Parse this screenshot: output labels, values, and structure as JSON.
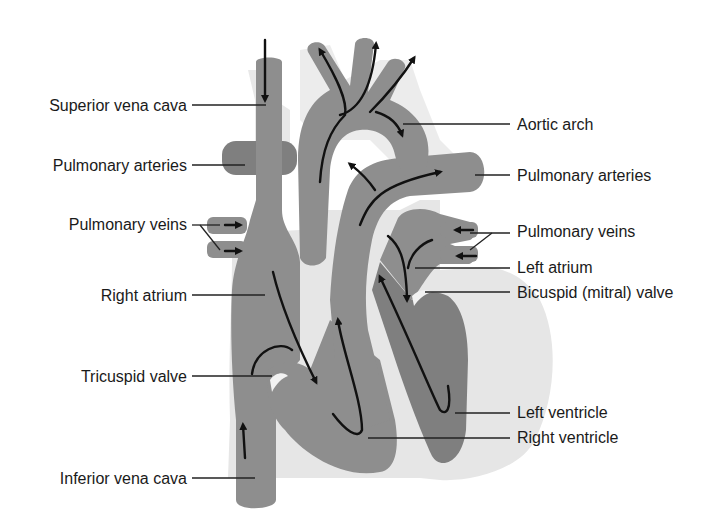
{
  "colors": {
    "vessel": "#8e8e8e",
    "heart_outline": "#e6e6e6",
    "arrow": "#111111",
    "label_text": "#1a1a1a",
    "background": "#ffffff"
  },
  "labels": {
    "left": [
      {
        "id": "superior-vena-cava",
        "text": "Superior vena cava"
      },
      {
        "id": "pulmonary-arteries-left",
        "text": "Pulmonary arteries"
      },
      {
        "id": "pulmonary-veins-left",
        "text": "Pulmonary veins"
      },
      {
        "id": "right-atrium",
        "text": "Right atrium"
      },
      {
        "id": "tricuspid-valve",
        "text": "Tricuspid valve"
      },
      {
        "id": "inferior-vena-cava",
        "text": "Inferior vena cava"
      }
    ],
    "right": [
      {
        "id": "aortic-arch",
        "text": "Aortic arch"
      },
      {
        "id": "pulmonary-arteries-right",
        "text": "Pulmonary arteries"
      },
      {
        "id": "pulmonary-veins-right",
        "text": "Pulmonary veins"
      },
      {
        "id": "left-atrium",
        "text": "Left atrium"
      },
      {
        "id": "bicuspid-valve",
        "text": "Bicuspid (mitral) valve"
      },
      {
        "id": "left-ventricle",
        "text": "Left ventricle"
      },
      {
        "id": "right-ventricle",
        "text": "Right ventricle"
      }
    ]
  }
}
